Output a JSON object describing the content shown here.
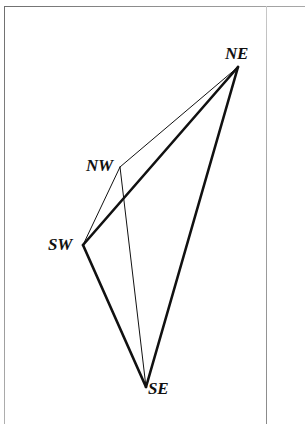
{
  "figure": {
    "background_color": "#ffffff",
    "ink_color": "#111111",
    "frame_color": "#9a9a9a",
    "vertices": [
      {
        "id": "NE",
        "label": "NE",
        "x": 238,
        "y": 67
      },
      {
        "id": "NW",
        "label": "NW",
        "x": 120,
        "y": 167
      },
      {
        "id": "SW",
        "label": "SW",
        "x": 83,
        "y": 245
      },
      {
        "id": "SE",
        "label": "SE",
        "x": 146,
        "y": 387
      }
    ],
    "edges": [
      {
        "id": "nw-ne",
        "from": "NW",
        "to": "NE",
        "weight": "thin",
        "stroke_width": 1.0
      },
      {
        "id": "nw-sw",
        "from": "NW",
        "to": "SW",
        "weight": "thin",
        "stroke_width": 1.0
      },
      {
        "id": "nw-se",
        "from": "NW",
        "to": "SE",
        "weight": "thin",
        "stroke_width": 1.0
      },
      {
        "id": "sw-ne",
        "from": "SW",
        "to": "NE",
        "weight": "thick",
        "stroke_width": 2.6
      },
      {
        "id": "sw-se",
        "from": "SW",
        "to": "SE",
        "weight": "thick",
        "stroke_width": 2.6
      },
      {
        "id": "se-ne",
        "from": "SE",
        "to": "NE",
        "weight": "thick",
        "stroke_width": 2.6
      }
    ],
    "labels": {
      "ne": "NE",
      "nw": "NW",
      "sw": "SW",
      "se": "SE"
    }
  }
}
